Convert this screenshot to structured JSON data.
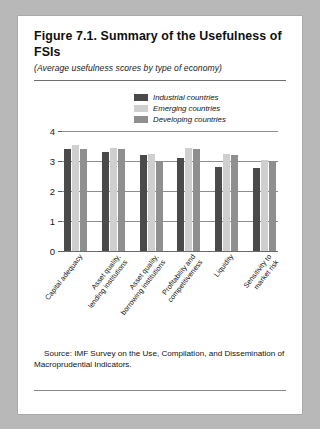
{
  "figure": {
    "title": "Figure 7.1.  Summary of the Usefulness of FSIs",
    "subtitle": "(Average usefulness scores by type of economy)",
    "source": "Source: IMF Survey on the Use, Compilation, and Dissemination of Macroprudential Indicators."
  },
  "chart_data": {
    "type": "bar",
    "title": "Summary of the Usefulness of FSIs",
    "subtitle": "(Average usefulness scores by type of economy)",
    "xlabel": "",
    "ylabel": "",
    "ylim": [
      0,
      4
    ],
    "yticks": [
      "0",
      "1",
      "2",
      "3",
      "4"
    ],
    "grid": true,
    "legend_position": "top-center",
    "categories": [
      "Capital adequacy",
      "Asset quality, lending institutions",
      "Asset quality, borrowing institutions",
      "Profitability and competitiveness",
      "Liquidity",
      "Sensitivity to market risk"
    ],
    "series": [
      {
        "name": "Industrial countries",
        "color": "#4a4a4a",
        "values": [
          3.4,
          3.3,
          3.2,
          3.1,
          2.8,
          2.78
        ]
      },
      {
        "name": "Emerging countries",
        "color": "#cfcfcf",
        "values": [
          3.55,
          3.45,
          3.25,
          3.45,
          3.25,
          3.05
        ]
      },
      {
        "name": "Developing countries",
        "color": "#8f8f8f",
        "values": [
          3.4,
          3.4,
          3.0,
          3.4,
          3.2,
          3.0
        ]
      }
    ]
  }
}
